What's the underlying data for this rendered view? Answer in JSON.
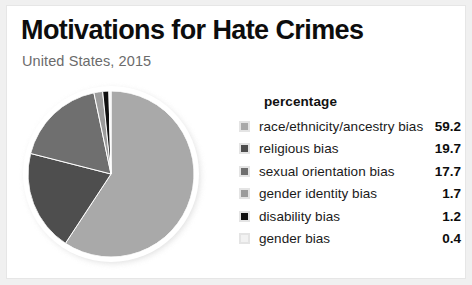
{
  "header": {
    "title": "Motivations for Hate Crimes",
    "subtitle": "United States, 2015"
  },
  "legend": {
    "header": "percentage"
  },
  "chart_data": {
    "type": "pie",
    "title": "Motivations for Hate Crimes",
    "subtitle": "United States, 2015",
    "value_header": "percentage",
    "units": "percent",
    "legend_position": "right",
    "start_angle_deg": 0,
    "direction": "clockwise",
    "categories": [
      "race/ethnicity/ancestry bias",
      "religious bias",
      "sexual orientation bias",
      "gender identity bias",
      "disability bias",
      "gender bias"
    ],
    "values": [
      59.2,
      19.7,
      17.7,
      1.7,
      1.2,
      0.4
    ],
    "value_labels": [
      "59.2",
      "19.7",
      "17.7",
      "1.7",
      "1.2",
      "0.4"
    ],
    "colors": [
      "#a9a9a9",
      "#4e4e4e",
      "#6f6f6f",
      "#9c9c9c",
      "#101010",
      "#f2f2f2"
    ],
    "slices": [
      {
        "label": "race/ethnicity/ancestry bias",
        "value": 59.2,
        "display": "59.2",
        "color": "#a9a9a9"
      },
      {
        "label": "religious bias",
        "value": 19.7,
        "display": "19.7",
        "color": "#4e4e4e"
      },
      {
        "label": "sexual orientation bias",
        "value": 17.7,
        "display": "17.7",
        "color": "#6f6f6f"
      },
      {
        "label": "gender identity bias",
        "value": 1.7,
        "display": "1.7",
        "color": "#9c9c9c"
      },
      {
        "label": "disability bias",
        "value": 1.2,
        "display": "1.2",
        "color": "#101010"
      },
      {
        "label": "gender bias",
        "value": 0.4,
        "display": "0.4",
        "color": "#f2f2f2"
      }
    ]
  }
}
